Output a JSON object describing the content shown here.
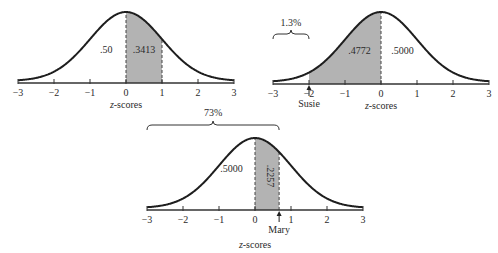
{
  "colors": {
    "curve": "#1e1e1e",
    "shade": "#b3b3b3",
    "axis": "#333333",
    "text": "#2a2a2a"
  },
  "panels": [
    {
      "id": "panel-left",
      "origin_x": 126,
      "axis_y": 83,
      "unit": 36,
      "peak_height": 71,
      "shade_from": 0,
      "shade_to": 1,
      "dashed_lines": [
        0,
        1
      ],
      "region_labels": [
        {
          "text": ".50",
          "z": -0.55,
          "dy": -30,
          "rotate": false
        },
        {
          "text": ".3413",
          "z": 0.5,
          "dy": -30,
          "rotate": false
        }
      ],
      "axis_title_italic": "z",
      "axis_title_rest": "-scores",
      "axis_title_z": 0,
      "axis_title_dy": 25,
      "ticks": [
        "−3",
        "−2",
        "−1",
        "0",
        "1",
        "2",
        "3"
      ],
      "brace": null,
      "marker": null
    },
    {
      "id": "panel-right",
      "origin_x": 381,
      "axis_y": 84,
      "unit": 36,
      "peak_height": 72,
      "shade_from": -2,
      "shade_to": 0,
      "dashed_lines": [
        0
      ],
      "region_labels": [
        {
          "text": ".4772",
          "z": -0.6,
          "dy": -30,
          "rotate": false
        },
        {
          "text": ".5000",
          "z": 0.6,
          "dy": -30,
          "rotate": false
        }
      ],
      "axis_title_italic": "z",
      "axis_title_rest": "-scores",
      "axis_title_z": 0,
      "axis_title_dy": 25,
      "ticks": [
        "−3",
        "−2",
        "−1",
        "0",
        "1",
        "2",
        "3"
      ],
      "brace": {
        "from": -3,
        "to": -2,
        "y": 34,
        "label": "1.3%",
        "label_dy": -8
      },
      "marker": {
        "z": -2,
        "label": "Susie"
      }
    },
    {
      "id": "panel-bottom",
      "origin_x": 255,
      "axis_y": 210,
      "unit": 36,
      "peak_height": 72,
      "shade_from": 0,
      "shade_to": 0.67,
      "dashed_lines": [
        0,
        0.67
      ],
      "region_labels": [
        {
          "text": ".5000",
          "z": -0.65,
          "dy": -38,
          "rotate": false
        },
        {
          "text": ".2257",
          "z": 0.34,
          "dy": -34,
          "rotate": true
        }
      ],
      "axis_title_italic": "z",
      "axis_title_rest": "-scores",
      "axis_title_z": 0,
      "axis_title_dy": 38,
      "ticks": [
        "−3",
        "−2",
        "−1",
        "0",
        "1",
        "2",
        "3"
      ],
      "brace": {
        "from": -3,
        "to": 0.67,
        "y": 125,
        "label": "73%",
        "label_dy": -9
      },
      "marker": {
        "z": 0.67,
        "label": "Mary"
      }
    }
  ]
}
